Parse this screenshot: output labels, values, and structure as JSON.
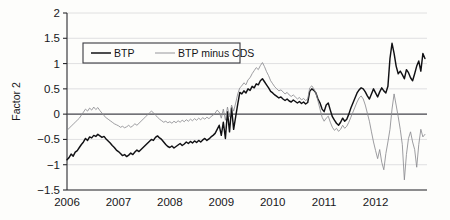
{
  "chart_data": {
    "type": "line",
    "title": "",
    "xlabel": "",
    "ylabel": "Factor 2",
    "xlim": [
      2006,
      2013.0
    ],
    "ylim": [
      -1.5,
      2
    ],
    "yticks": [
      -1.5,
      -1,
      -0.5,
      0,
      0.5,
      1,
      1.5,
      2
    ],
    "ytick_labels": [
      "−1.5",
      "−1",
      "−0.5",
      "0",
      "0.5",
      "1",
      "1.5",
      "2"
    ],
    "xticks": [
      2006,
      2007,
      2008,
      2009,
      2010,
      2011,
      2012
    ],
    "xtick_labels": [
      "2006",
      "2007",
      "2008",
      "2009",
      "2010",
      "2011",
      "2012"
    ],
    "grid": true,
    "grid_axis": "y",
    "zero_line": true,
    "legend": {
      "position": "upper-left-inside",
      "entries": [
        {
          "label": "BTP",
          "color": "#111114",
          "width": 1.5
        },
        {
          "label": "BTP minus CDS",
          "color": "#8b8b90",
          "width": 0.9
        }
      ]
    },
    "series": [
      {
        "name": "BTP",
        "color": "#111114",
        "x": [
          2006.0,
          2006.04,
          2006.08,
          2006.12,
          2006.16,
          2006.2,
          2006.24,
          2006.28,
          2006.32,
          2006.36,
          2006.4,
          2006.44,
          2006.48,
          2006.52,
          2006.56,
          2006.6,
          2006.64,
          2006.68,
          2006.72,
          2006.76,
          2006.8,
          2006.84,
          2006.88,
          2006.92,
          2006.96,
          2007.0,
          2007.04,
          2007.08,
          2007.12,
          2007.16,
          2007.2,
          2007.24,
          2007.28,
          2007.32,
          2007.36,
          2007.4,
          2007.44,
          2007.48,
          2007.52,
          2007.56,
          2007.6,
          2007.64,
          2007.68,
          2007.72,
          2007.76,
          2007.8,
          2007.84,
          2007.88,
          2007.92,
          2007.96,
          2008.0,
          2008.04,
          2008.08,
          2008.12,
          2008.16,
          2008.2,
          2008.24,
          2008.28,
          2008.32,
          2008.36,
          2008.4,
          2008.44,
          2008.48,
          2008.52,
          2008.56,
          2008.6,
          2008.64,
          2008.68,
          2008.72,
          2008.76,
          2008.8,
          2008.84,
          2008.88,
          2008.92,
          2008.96,
          2009.0,
          2009.04,
          2009.08,
          2009.12,
          2009.16,
          2009.2,
          2009.24,
          2009.28,
          2009.32,
          2009.36,
          2009.4,
          2009.44,
          2009.48,
          2009.52,
          2009.56,
          2009.6,
          2009.64,
          2009.68,
          2009.72,
          2009.76,
          2009.8,
          2009.84,
          2009.88,
          2009.92,
          2009.96,
          2010.0,
          2010.04,
          2010.08,
          2010.12,
          2010.16,
          2010.2,
          2010.24,
          2010.28,
          2010.32,
          2010.36,
          2010.4,
          2010.44,
          2010.48,
          2010.52,
          2010.56,
          2010.6,
          2010.64,
          2010.68,
          2010.72,
          2010.76,
          2010.8,
          2010.84,
          2010.88,
          2010.92,
          2010.96,
          2011.0,
          2011.04,
          2011.08,
          2011.12,
          2011.16,
          2011.2,
          2011.24,
          2011.28,
          2011.32,
          2011.36,
          2011.4,
          2011.44,
          2011.48,
          2011.52,
          2011.56,
          2011.6,
          2011.64,
          2011.68,
          2011.72,
          2011.76,
          2011.8,
          2011.84,
          2011.88,
          2011.92,
          2011.96,
          2012.0,
          2012.04,
          2012.08,
          2012.12,
          2012.16,
          2012.2,
          2012.24,
          2012.28,
          2012.32,
          2012.36,
          2012.4,
          2012.44,
          2012.48,
          2012.52,
          2012.56,
          2012.6,
          2012.64,
          2012.68,
          2012.72,
          2012.76,
          2012.8,
          2012.84,
          2012.88,
          2012.92,
          2012.96
        ],
        "y": [
          -0.9,
          -0.86,
          -0.79,
          -0.83,
          -0.75,
          -0.72,
          -0.66,
          -0.6,
          -0.55,
          -0.48,
          -0.52,
          -0.45,
          -0.47,
          -0.42,
          -0.44,
          -0.4,
          -0.43,
          -0.46,
          -0.44,
          -0.49,
          -0.53,
          -0.57,
          -0.62,
          -0.66,
          -0.71,
          -0.74,
          -0.78,
          -0.82,
          -0.8,
          -0.84,
          -0.81,
          -0.77,
          -0.8,
          -0.75,
          -0.71,
          -0.74,
          -0.7,
          -0.66,
          -0.62,
          -0.58,
          -0.54,
          -0.5,
          -0.52,
          -0.46,
          -0.43,
          -0.47,
          -0.5,
          -0.55,
          -0.6,
          -0.64,
          -0.66,
          -0.63,
          -0.67,
          -0.64,
          -0.61,
          -0.58,
          -0.62,
          -0.59,
          -0.55,
          -0.58,
          -0.54,
          -0.57,
          -0.53,
          -0.56,
          -0.52,
          -0.55,
          -0.51,
          -0.48,
          -0.52,
          -0.49,
          -0.45,
          -0.42,
          -0.38,
          -0.3,
          -0.22,
          -0.42,
          -0.16,
          -0.48,
          0.05,
          -0.35,
          0.12,
          -0.3,
          -0.05,
          0.2,
          0.43,
          0.4,
          0.46,
          0.42,
          0.5,
          0.47,
          0.55,
          0.52,
          0.6,
          0.58,
          0.66,
          0.7,
          0.64,
          0.58,
          0.52,
          0.45,
          0.42,
          0.38,
          0.35,
          0.32,
          0.34,
          0.3,
          0.27,
          0.3,
          0.26,
          0.24,
          0.28,
          0.25,
          0.22,
          0.25,
          0.21,
          0.24,
          0.2,
          0.23,
          0.45,
          0.5,
          0.47,
          0.42,
          0.3,
          0.22,
          0.1,
          0.05,
          0.18,
          0.22,
          0.08,
          -0.05,
          -0.12,
          -0.18,
          -0.22,
          -0.16,
          -0.08,
          -0.14,
          -0.1,
          0.0,
          0.12,
          0.22,
          0.32,
          0.42,
          0.48,
          0.52,
          0.5,
          0.44,
          0.36,
          0.3,
          0.4,
          0.5,
          0.42,
          0.34,
          0.44,
          0.52,
          0.46,
          0.42,
          0.55,
          1.1,
          1.4,
          1.2,
          0.95,
          0.8,
          0.85,
          0.78,
          0.7,
          0.88,
          0.82,
          0.72,
          0.66,
          0.8,
          0.95,
          1.05,
          0.85,
          1.2,
          1.1
        ]
      },
      {
        "name": "BTP minus CDS",
        "color": "#8b8b90",
        "x": [
          2006.0,
          2006.04,
          2006.08,
          2006.12,
          2006.16,
          2006.2,
          2006.24,
          2006.28,
          2006.32,
          2006.36,
          2006.4,
          2006.44,
          2006.48,
          2006.52,
          2006.56,
          2006.6,
          2006.64,
          2006.68,
          2006.72,
          2006.76,
          2006.8,
          2006.84,
          2006.88,
          2006.92,
          2006.96,
          2007.0,
          2007.04,
          2007.08,
          2007.12,
          2007.16,
          2007.2,
          2007.24,
          2007.28,
          2007.32,
          2007.36,
          2007.4,
          2007.44,
          2007.48,
          2007.52,
          2007.56,
          2007.6,
          2007.64,
          2007.68,
          2007.72,
          2007.76,
          2007.8,
          2007.84,
          2007.88,
          2007.92,
          2007.96,
          2008.0,
          2008.04,
          2008.08,
          2008.12,
          2008.16,
          2008.2,
          2008.24,
          2008.28,
          2008.32,
          2008.36,
          2008.4,
          2008.44,
          2008.48,
          2008.52,
          2008.56,
          2008.6,
          2008.64,
          2008.68,
          2008.72,
          2008.76,
          2008.8,
          2008.84,
          2008.88,
          2008.92,
          2008.96,
          2009.0,
          2009.04,
          2009.08,
          2009.12,
          2009.16,
          2009.2,
          2009.24,
          2009.28,
          2009.32,
          2009.36,
          2009.4,
          2009.44,
          2009.48,
          2009.52,
          2009.56,
          2009.6,
          2009.64,
          2009.68,
          2009.72,
          2009.76,
          2009.8,
          2009.84,
          2009.88,
          2009.92,
          2009.96,
          2010.0,
          2010.04,
          2010.08,
          2010.12,
          2010.16,
          2010.2,
          2010.24,
          2010.28,
          2010.32,
          2010.36,
          2010.4,
          2010.44,
          2010.48,
          2010.52,
          2010.56,
          2010.6,
          2010.64,
          2010.68,
          2010.72,
          2010.76,
          2010.8,
          2010.84,
          2010.88,
          2010.92,
          2010.96,
          2011.0,
          2011.04,
          2011.08,
          2011.12,
          2011.16,
          2011.2,
          2011.24,
          2011.28,
          2011.32,
          2011.36,
          2011.4,
          2011.44,
          2011.48,
          2011.52,
          2011.56,
          2011.6,
          2011.64,
          2011.68,
          2011.72,
          2011.76,
          2011.8,
          2011.84,
          2011.88,
          2011.92,
          2011.96,
          2012.0,
          2012.04,
          2012.08,
          2012.12,
          2012.16,
          2012.2,
          2012.24,
          2012.28,
          2012.32,
          2012.36,
          2012.4,
          2012.44,
          2012.48,
          2012.52,
          2012.56,
          2012.6,
          2012.64,
          2012.68,
          2012.72,
          2012.76,
          2012.8,
          2012.84,
          2012.88,
          2012.92,
          2012.96
        ],
        "y": [
          -0.32,
          -0.28,
          -0.24,
          -0.2,
          -0.16,
          -0.12,
          -0.08,
          -0.02,
          0.04,
          0.1,
          0.06,
          0.12,
          0.08,
          0.14,
          0.09,
          0.13,
          0.07,
          0.02,
          -0.03,
          -0.07,
          -0.1,
          -0.13,
          -0.16,
          -0.19,
          -0.21,
          -0.23,
          -0.26,
          -0.24,
          -0.27,
          -0.25,
          -0.22,
          -0.26,
          -0.23,
          -0.19,
          -0.22,
          -0.18,
          -0.14,
          -0.1,
          -0.06,
          -0.02,
          0.02,
          0.06,
          0.03,
          -0.02,
          -0.06,
          -0.1,
          -0.13,
          -0.16,
          -0.14,
          -0.17,
          -0.15,
          -0.18,
          -0.14,
          -0.17,
          -0.13,
          -0.16,
          -0.12,
          -0.15,
          -0.11,
          -0.14,
          -0.1,
          -0.13,
          -0.09,
          -0.12,
          -0.08,
          -0.11,
          -0.07,
          -0.1,
          -0.06,
          -0.09,
          -0.05,
          -0.02,
          0.02,
          0.08,
          0.04,
          -0.08,
          0.1,
          -0.12,
          0.14,
          -0.05,
          0.18,
          0.06,
          0.22,
          0.4,
          0.52,
          0.56,
          0.62,
          0.58,
          0.68,
          0.72,
          0.8,
          0.86,
          0.92,
          0.88,
          0.96,
          1.02,
          0.94,
          0.84,
          0.76,
          0.66,
          0.6,
          0.54,
          0.5,
          0.46,
          0.48,
          0.44,
          0.4,
          0.43,
          0.38,
          0.35,
          0.38,
          0.34,
          0.3,
          0.33,
          0.28,
          0.31,
          0.27,
          0.3,
          0.52,
          0.56,
          0.5,
          0.42,
          0.26,
          0.1,
          -0.06,
          -0.14,
          -0.08,
          -0.04,
          -0.16,
          -0.26,
          -0.32,
          -0.28,
          -0.34,
          -0.3,
          -0.22,
          -0.28,
          -0.24,
          -0.16,
          -0.06,
          0.04,
          0.14,
          0.24,
          0.32,
          0.36,
          0.3,
          0.18,
          0.02,
          -0.14,
          -0.35,
          -0.55,
          -0.72,
          -0.88,
          -0.7,
          -0.95,
          -1.1,
          -0.78,
          -0.55,
          -0.3,
          0.1,
          0.4,
          0.18,
          -0.05,
          -0.3,
          -0.6,
          -1.3,
          -0.8,
          -0.48,
          -0.35,
          -0.55,
          -0.7,
          -1.05,
          -0.6,
          -0.3,
          -0.45,
          -0.4
        ]
      }
    ]
  }
}
